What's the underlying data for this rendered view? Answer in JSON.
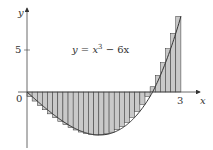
{
  "chart_data": {
    "type": "bar",
    "title": "",
    "function_label": "y = x^3 - 6x",
    "function_label_parts": {
      "lhs": "y",
      "eq": " = ",
      "x": "x",
      "exp": "3",
      "rest": " − 6x"
    },
    "xlabel": "x",
    "ylabel": "y",
    "x_ticks": [
      {
        "value": 0,
        "label": "0"
      },
      {
        "value": 3,
        "label": "3"
      }
    ],
    "y_ticks": [
      {
        "value": 5,
        "label": "5"
      }
    ],
    "xlim": [
      0,
      3
    ],
    "ylim": [
      -6,
      9
    ],
    "n_rectangles": 30,
    "delta_x": 0.1,
    "sample_rule": "right endpoints",
    "x": [
      0.1,
      0.2,
      0.3,
      0.4,
      0.5,
      0.6,
      0.7,
      0.8,
      0.9,
      1.0,
      1.1,
      1.2,
      1.3,
      1.4,
      1.5,
      1.6,
      1.7,
      1.8,
      1.9,
      2.0,
      2.1,
      2.2,
      2.3,
      2.4,
      2.5,
      2.6,
      2.7,
      2.8,
      2.9,
      3.0
    ],
    "values": [
      -0.599,
      -1.192,
      -1.773,
      -2.336,
      -2.875,
      -3.384,
      -3.857,
      -4.288,
      -4.671,
      -5.0,
      -5.269,
      -5.472,
      -5.603,
      -5.656,
      -5.625,
      -5.504,
      -5.287,
      -4.968,
      -4.541,
      -4.0,
      -3.339,
      -2.552,
      -1.633,
      -0.576,
      0.625,
      1.976,
      3.483,
      5.152,
      6.989,
      9.0
    ],
    "grid": false,
    "legend": null
  },
  "colors": {
    "fill": "#c9c9c9",
    "stroke": "#333333",
    "axis": "#444444"
  }
}
